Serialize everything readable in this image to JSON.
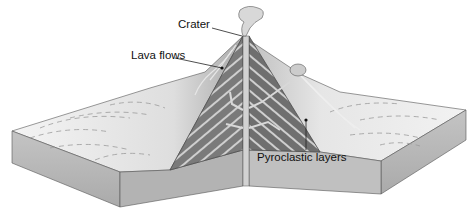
{
  "diagram": {
    "labels": {
      "crater": "Crater",
      "lava_flows": "Lava flows",
      "pyroclastic_layers": "Pyroclastic layers"
    },
    "colors": {
      "background": "#ffffff",
      "ground_surface_light": "#f2f2f2",
      "ground_surface_mid": "#cfcfcf",
      "block_side_front": "#b8b8b8",
      "block_side_dark": "#9c9c9c",
      "cone_section_dark": "#6e6e6e",
      "cone_section_light": "#a8a8a8",
      "layer_stripe": "#d4d4d4",
      "vent": "#cfcfcf",
      "text": "#111111"
    }
  }
}
